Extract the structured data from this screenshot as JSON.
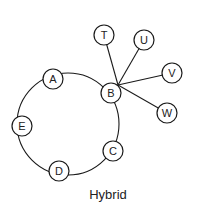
{
  "diagram": {
    "caption": "Hybrid",
    "ring": {
      "center": [
        68,
        124
      ],
      "radius": 51,
      "nodes": [
        "A",
        "B",
        "C",
        "D",
        "E"
      ]
    },
    "star": {
      "hub": [
        118,
        85
      ],
      "center_node": "B",
      "leaves": [
        "T",
        "U",
        "V",
        "W"
      ]
    },
    "nodes": {
      "A": {
        "label": "A",
        "x": 53,
        "y": 79
      },
      "B": {
        "label": "B",
        "x": 111,
        "y": 93
      },
      "C": {
        "label": "C",
        "x": 113,
        "y": 151
      },
      "D": {
        "label": "D",
        "x": 59,
        "y": 171
      },
      "E": {
        "label": "E",
        "x": 22,
        "y": 126
      },
      "T": {
        "label": "T",
        "x": 104,
        "y": 35
      },
      "U": {
        "label": "U",
        "x": 144,
        "y": 40
      },
      "V": {
        "label": "V",
        "x": 172,
        "y": 73
      },
      "W": {
        "label": "W",
        "x": 167,
        "y": 113
      }
    },
    "node_radius": 10,
    "colors": {
      "stroke": "#1a1a1a",
      "fill": "#ffffff",
      "text": "#222222"
    }
  }
}
